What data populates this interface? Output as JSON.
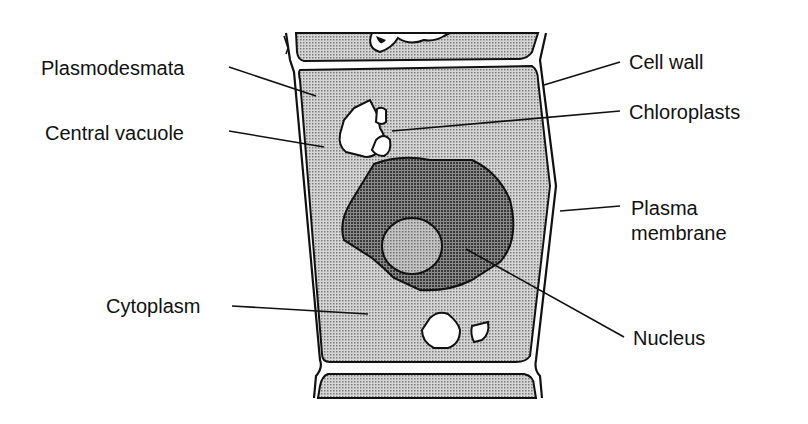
{
  "diagram": {
    "colors": {
      "background": "#ffffff",
      "cytoplasm_fill": "#bdbdbd",
      "nucleus_fill": "#6e6e6e",
      "nucleolus_fill": "#a8a8a8",
      "vacuole_fill": "#ffffff",
      "outline": "#111111"
    },
    "labels": {
      "plasmodesmata": "Plasmodesmata",
      "central_vacuole": "Central vacuole",
      "cytoplasm": "Cytoplasm",
      "cell_wall": "Cell wall",
      "chloroplasts": "Chloroplasts",
      "plasma_membrane": "Plasma\nmembrane",
      "nucleus": "Nucleus"
    }
  }
}
